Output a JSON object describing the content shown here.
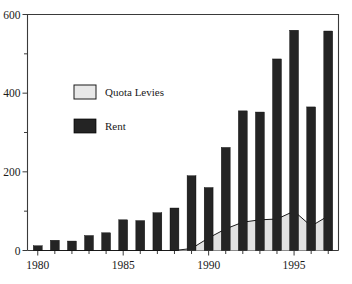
{
  "figure": {
    "clipped_header_text": "",
    "background": "#ffffff"
  },
  "legend": {
    "position": "inside-upper-left",
    "entries": [
      {
        "label": "Quota Levies",
        "color": "#e8e8e8",
        "swatch": "light-box"
      },
      {
        "label": "Rent",
        "color": "#242424",
        "swatch": "dark-box"
      }
    ]
  },
  "axes": {
    "y_ticks": [
      "0",
      "200",
      "400",
      "600"
    ],
    "x_ticks": [
      "1980",
      "1985",
      "1990",
      "1995"
    ]
  },
  "chart_data": {
    "type": "bar",
    "title": "",
    "subtitle": "",
    "xlabel": "",
    "ylabel": "",
    "xlim": [
      1979.4,
      1997.6
    ],
    "ylim": [
      0,
      600
    ],
    "grid": false,
    "legend_position": "upper left (inside plot)",
    "categories": [
      "1980",
      "1981",
      "1982",
      "1983",
      "1984",
      "1985",
      "1986",
      "1987",
      "1988",
      "1989",
      "1990",
      "1991",
      "1992",
      "1993",
      "1994",
      "1995",
      "1996",
      "1997"
    ],
    "x": [
      1980,
      1981,
      1982,
      1983,
      1984,
      1985,
      1986,
      1987,
      1988,
      1989,
      1990,
      1991,
      1992,
      1993,
      1994,
      1995,
      1996,
      1997
    ],
    "series": [
      {
        "name": "Rent",
        "type": "bar",
        "color": "#242424",
        "values": [
          12,
          26,
          24,
          38,
          45,
          78,
          76,
          96,
          108,
          190,
          160,
          262,
          355,
          352,
          487,
          560,
          365,
          558
        ]
      },
      {
        "name": "Quota Levies",
        "type": "area",
        "color": "#e8e8e8",
        "values": [
          0,
          0,
          0,
          0,
          0,
          0,
          0,
          0,
          0,
          5,
          32,
          55,
          72,
          78,
          80,
          100,
          62,
          88
        ]
      }
    ]
  }
}
